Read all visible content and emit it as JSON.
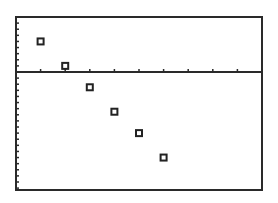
{
  "chart_data": {
    "type": "scatter",
    "title": "",
    "xlabel": "",
    "ylabel": "",
    "grid": false,
    "legend": null,
    "marker": "hollow-square",
    "xlim": [
      0,
      10
    ],
    "ylim": [
      -20,
      9
    ],
    "x_tick_step": 1,
    "y_tick_step": 1,
    "points": [
      {
        "x": 1,
        "y": 5
      },
      {
        "x": 2,
        "y": 1
      },
      {
        "x": 3,
        "y": -2.5
      },
      {
        "x": 4,
        "y": -6.5
      },
      {
        "x": 5,
        "y": -10
      },
      {
        "x": 6,
        "y": -14
      }
    ],
    "colors": {
      "axis": "#2a2a2a",
      "marker": "#222222",
      "background": "#ffffff"
    }
  },
  "layout": {
    "frame": {
      "left": 16,
      "top": 17,
      "right": 262,
      "bottom": 190
    },
    "x_axis_y": 72
  }
}
